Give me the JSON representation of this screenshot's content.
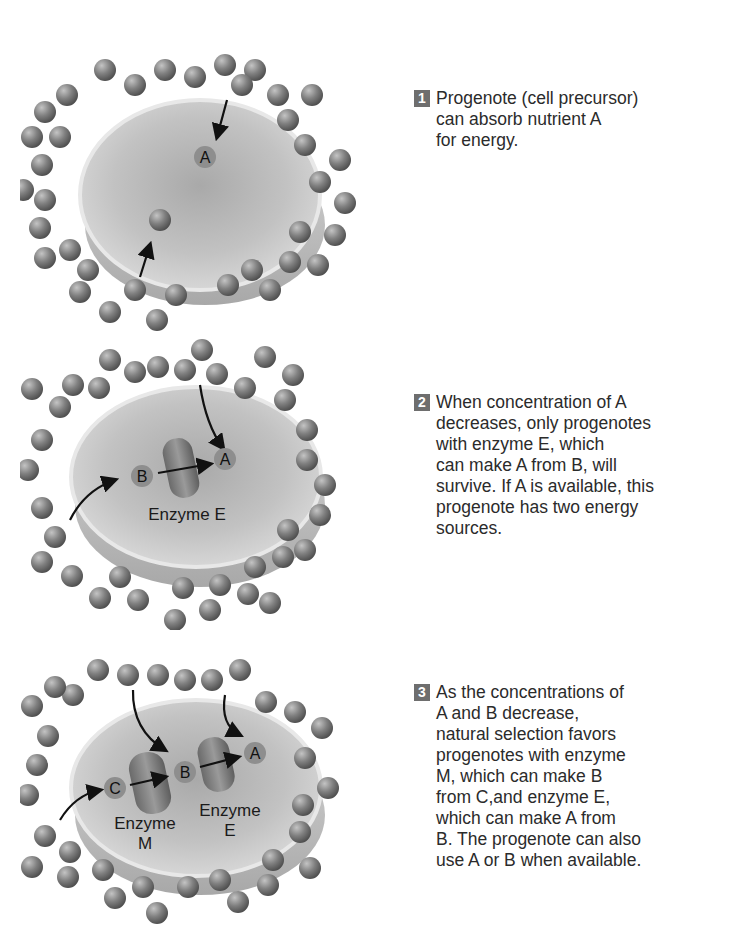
{
  "steps": [
    {
      "number": "1",
      "text": "Progenote (cell precursor)\ncan absorb nutrient A\nfor energy.",
      "molecules": [
        "A"
      ]
    },
    {
      "number": "2",
      "text": "When concentration of A\ndecreases, only progenotes\nwith enzyme E, which\ncan make A from B, will\nsurvive. If A is available, this\nprogenote has two energy\nsources.",
      "molecules": [
        "B",
        "A"
      ],
      "enzymes": [
        "Enzyme E"
      ]
    },
    {
      "number": "3",
      "text": "As the concentrations of\nA and B decrease,\nnatural selection favors\nprogenotes with enzyme\nM, which can make B\nfrom C,and enzyme E,\nwhich can make A from\nB. The progenote can also\nuse A or B when available.",
      "molecules": [
        "C",
        "B",
        "A"
      ],
      "enzymes": [
        "Enzyme",
        "M",
        "Enzyme",
        "E"
      ]
    }
  ],
  "colors": {
    "badge": "#6e6e6e",
    "sphere": "#7c7c7c",
    "cell": "#cfcfcf",
    "text": "#2b2b2b"
  }
}
